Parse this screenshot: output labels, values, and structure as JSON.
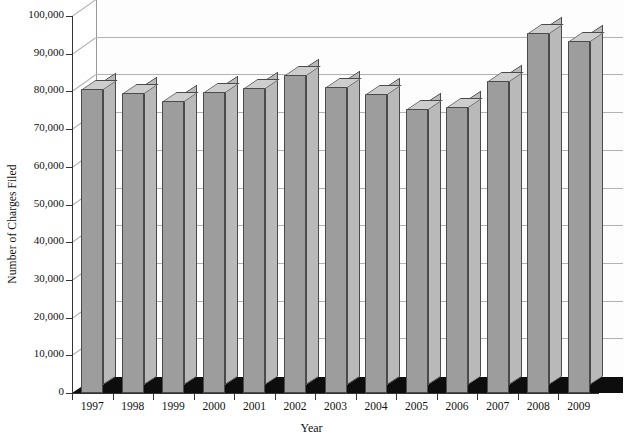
{
  "chart_data": {
    "type": "bar",
    "title": "",
    "xlabel": "Year",
    "ylabel": "Number of Charges Filed",
    "categories": [
      "1997",
      "1998",
      "1999",
      "2000",
      "2001",
      "2002",
      "2003",
      "2004",
      "2005",
      "2006",
      "2007",
      "2008",
      "2009"
    ],
    "values": [
      80680,
      79591,
      77444,
      79896,
      80840,
      84442,
      81293,
      79432,
      75428,
      75768,
      82792,
      95402,
      93277
    ],
    "ylim": [
      0,
      100000
    ],
    "ytick_values": [
      0,
      10000,
      20000,
      30000,
      40000,
      50000,
      60000,
      70000,
      80000,
      90000,
      100000
    ],
    "ytick_labels": [
      "0",
      "10,000",
      "20,000",
      "30,000",
      "40,000",
      "50,000",
      "60,000",
      "70,000",
      "80,000",
      "90,000",
      "100,000"
    ],
    "grid": true,
    "legend": "none",
    "style": "3d-column",
    "colors": {
      "bar_front": "#9d9d9d",
      "bar_side": "#b9b9b9",
      "bar_top": "#cdcdcd",
      "bar_edge": "#4a4a4a",
      "floor": "#0d0d0d",
      "gridline": "#b2b2b2",
      "axis": "#333333",
      "background": "#ffffff"
    }
  }
}
